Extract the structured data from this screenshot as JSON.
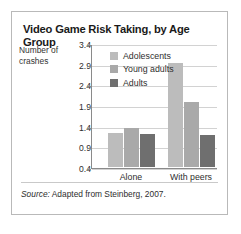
{
  "figure": {
    "title": "Video Game Risk Taking, by Age Group",
    "source_keyword": "Source:",
    "source_text": " Adapted from Steinberg, 2007."
  },
  "chart_data": {
    "type": "bar",
    "title": "Video Game Risk Taking, by Age Group",
    "xlabel": "",
    "ylabel": "Number of crashes",
    "ylabel_line1": "Number of",
    "ylabel_line2": "crashes",
    "categories": [
      "Alone",
      "With peers"
    ],
    "ylim": [
      0.4,
      3.4
    ],
    "yticks": [
      "3.4",
      "2.9",
      "2.4",
      "1.9",
      "1.4",
      "0.9",
      "0.4"
    ],
    "ytick_values": [
      3.4,
      2.9,
      2.4,
      1.9,
      1.4,
      0.9,
      0.4
    ],
    "grid": true,
    "legend_position": "upper-left-inside",
    "series": [
      {
        "name": "Adolescents",
        "color": "#bcbcbc",
        "values": [
          1.23,
          2.92
        ]
      },
      {
        "name": "Young adults",
        "color": "#a9a9a9",
        "values": [
          1.34,
          1.98
        ]
      },
      {
        "name": "Adults",
        "color": "#6f6f6f",
        "values": [
          1.21,
          1.17
        ]
      }
    ]
  }
}
